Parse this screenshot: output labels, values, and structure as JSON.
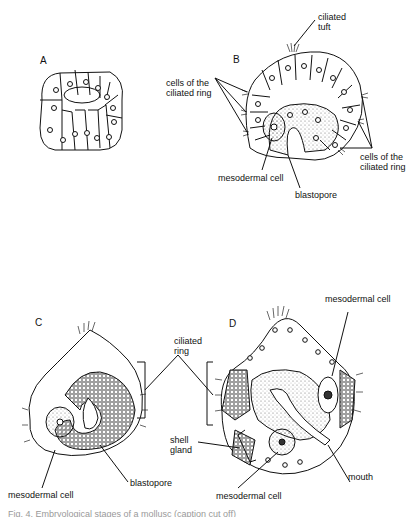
{
  "figure": {
    "panels": [
      {
        "id": "A",
        "letter": "A"
      },
      {
        "id": "B",
        "letter": "B",
        "labels": {
          "ciliated_tuft": "ciliated\ntuft",
          "ring_left": "cells of the\nciliated ring",
          "ring_right": "cells of the\nciliated ring",
          "mesodermal_cell": "mesodermal cell",
          "blastopore": "blastopore"
        }
      },
      {
        "id": "C",
        "letter": "C",
        "labels": {
          "mesodermal_cell": "mesodermal cell",
          "blastopore": "blastopore"
        }
      },
      {
        "id": "D",
        "letter": "D",
        "labels": {
          "mesodermal_cell_top": "mesodermal cell",
          "shell_gland": "shell\ngland",
          "mouth": "mouth",
          "mesodermal_cell_bottom": "mesodermal cell"
        }
      }
    ],
    "shared_labels": {
      "ciliated_ring": "ciliated\nring"
    },
    "caption": "Fig. 4. Embryological stages of a mollusc (caption cut off)"
  }
}
